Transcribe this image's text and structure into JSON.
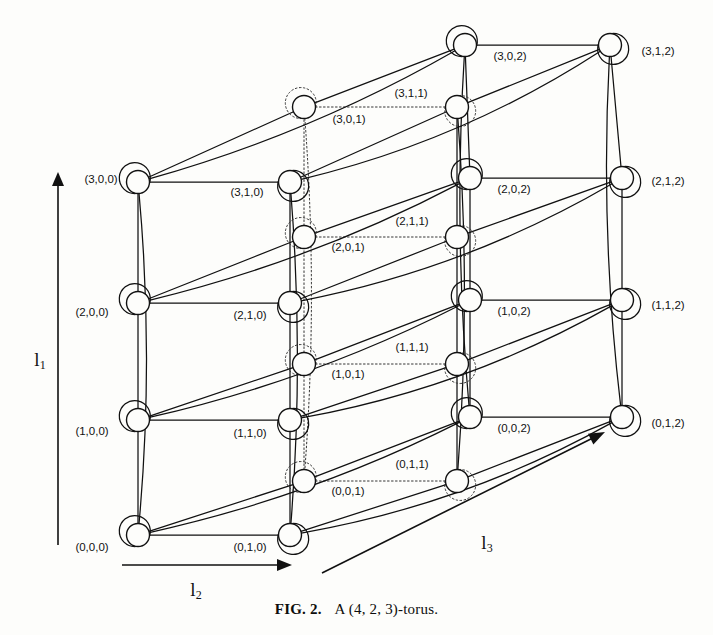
{
  "figure": {
    "caption_number": "FIG. 2.",
    "caption_text": "A (4, 2, 3)-torus.",
    "torus_dims": [
      4,
      2,
      3
    ]
  },
  "axes": [
    {
      "name": "l1",
      "label": "l",
      "sub": "1",
      "direction": "up",
      "x": 58,
      "y1": 545,
      "y2": 172,
      "label_x": 40,
      "label_y": 362
    },
    {
      "name": "l2",
      "label": "l",
      "sub": "2",
      "direction": "right",
      "x1": 122,
      "x2": 292,
      "y": 565,
      "label_x": 196,
      "label_y": 592
    },
    {
      "name": "l3",
      "label": "l",
      "sub": "3",
      "direction": "upright",
      "x1": 322,
      "y1": 573,
      "x2": 605,
      "y2": 432,
      "label_x": 487,
      "label_y": 545
    }
  ],
  "chart_data": {
    "type": "diagram",
    "title": "A (4, 2, 3)-torus",
    "geometry": {
      "origin_x": 138,
      "origin_y": 535,
      "step_i_y": -118.5,
      "step_j_x": 152,
      "step_j_y": 0,
      "step_k_x": 166,
      "step_k_y": -82,
      "node_radius": 11.5
    },
    "nodes": [
      {
        "id": "0,0,0",
        "label": "(0,0,0)",
        "i": 0,
        "j": 0,
        "k": 0,
        "x": 138,
        "y": 535,
        "lx": 92,
        "ly": 548,
        "anchor": "middle"
      },
      {
        "id": "0,1,0",
        "label": "(0,1,0)",
        "i": 0,
        "j": 1,
        "k": 0,
        "x": 290,
        "y": 535,
        "lx": 250,
        "ly": 548,
        "anchor": "middle"
      },
      {
        "id": "1,0,0",
        "label": "(1,0,0)",
        "i": 1,
        "j": 0,
        "k": 0,
        "x": 138,
        "y": 420,
        "lx": 92,
        "ly": 432,
        "anchor": "middle"
      },
      {
        "id": "1,1,0",
        "label": "(1,1,0)",
        "i": 1,
        "j": 1,
        "k": 0,
        "x": 290,
        "y": 420,
        "lx": 250,
        "ly": 434,
        "anchor": "middle"
      },
      {
        "id": "2,0,0",
        "label": "(2,0,0)",
        "i": 2,
        "j": 0,
        "k": 0,
        "x": 138,
        "y": 303,
        "lx": 92,
        "ly": 313,
        "anchor": "middle"
      },
      {
        "id": "2,1,0",
        "label": "(2,1,0)",
        "i": 2,
        "j": 1,
        "k": 0,
        "x": 290,
        "y": 303,
        "lx": 250,
        "ly": 316,
        "anchor": "middle"
      },
      {
        "id": "3,0,0",
        "label": "(3,0,0)",
        "i": 3,
        "j": 0,
        "k": 0,
        "x": 138,
        "y": 182,
        "lx": 101,
        "ly": 180,
        "anchor": "middle"
      },
      {
        "id": "3,1,0",
        "label": "(3,1,0)",
        "i": 3,
        "j": 1,
        "k": 0,
        "x": 290,
        "y": 182,
        "lx": 247,
        "ly": 193,
        "anchor": "middle"
      },
      {
        "id": "0,0,1",
        "label": "(0,0,1)",
        "i": 0,
        "j": 0,
        "k": 1,
        "x": 304,
        "y": 481,
        "lx": 348,
        "ly": 492,
        "anchor": "middle"
      },
      {
        "id": "0,1,1",
        "label": "(0,1,1)",
        "i": 0,
        "j": 1,
        "k": 1,
        "x": 457,
        "y": 481,
        "lx": 412,
        "ly": 465,
        "anchor": "middle"
      },
      {
        "id": "1,0,1",
        "label": "(1,0,1)",
        "i": 1,
        "j": 0,
        "k": 1,
        "x": 304,
        "y": 364,
        "lx": 348,
        "ly": 375,
        "anchor": "middle"
      },
      {
        "id": "1,1,1",
        "label": "(1,1,1)",
        "i": 1,
        "j": 1,
        "k": 1,
        "x": 457,
        "y": 364,
        "lx": 412,
        "ly": 348,
        "anchor": "middle"
      },
      {
        "id": "2,0,1",
        "label": "(2,0,1)",
        "i": 2,
        "j": 0,
        "k": 1,
        "x": 304,
        "y": 237,
        "lx": 348,
        "ly": 248,
        "anchor": "middle"
      },
      {
        "id": "2,1,1",
        "label": "(2,1,1)",
        "i": 2,
        "j": 1,
        "k": 1,
        "x": 457,
        "y": 237,
        "lx": 412,
        "ly": 222,
        "anchor": "middle"
      },
      {
        "id": "3,0,1",
        "label": "(3,0,1)",
        "i": 3,
        "j": 0,
        "k": 1,
        "x": 304,
        "y": 107,
        "lx": 349,
        "ly": 120,
        "anchor": "middle"
      },
      {
        "id": "3,1,1",
        "label": "(3,1,1)",
        "i": 3,
        "j": 1,
        "k": 1,
        "x": 457,
        "y": 107,
        "lx": 411,
        "ly": 94,
        "anchor": "middle"
      },
      {
        "id": "0,0,2",
        "label": "(0,0,2)",
        "i": 0,
        "j": 0,
        "k": 2,
        "x": 470,
        "y": 417,
        "lx": 514,
        "ly": 429,
        "anchor": "middle"
      },
      {
        "id": "0,1,2",
        "label": "(0,1,2)",
        "i": 0,
        "j": 1,
        "k": 2,
        "x": 622,
        "y": 417,
        "lx": 668,
        "ly": 424,
        "anchor": "middle"
      },
      {
        "id": "1,0,2",
        "label": "(1,0,2)",
        "i": 1,
        "j": 0,
        "k": 2,
        "x": 470,
        "y": 300,
        "lx": 514,
        "ly": 312,
        "anchor": "middle"
      },
      {
        "id": "1,1,2",
        "label": "(1,1,2)",
        "i": 1,
        "j": 1,
        "k": 2,
        "x": 622,
        "y": 300,
        "lx": 668,
        "ly": 306,
        "anchor": "middle"
      },
      {
        "id": "2,0,2",
        "label": "(2,0,2)",
        "i": 2,
        "j": 0,
        "k": 2,
        "x": 470,
        "y": 178,
        "lx": 514,
        "ly": 190,
        "anchor": "middle"
      },
      {
        "id": "2,1,2",
        "label": "(2,1,2)",
        "i": 2,
        "j": 1,
        "k": 2,
        "x": 622,
        "y": 178,
        "lx": 668,
        "ly": 182,
        "anchor": "middle"
      },
      {
        "id": "3,0,2",
        "label": "(3,0,2)",
        "i": 3,
        "j": 0,
        "k": 2,
        "x": 465,
        "y": 45,
        "lx": 510,
        "ly": 57,
        "anchor": "middle"
      },
      {
        "id": "3,1,2",
        "label": "(3,1,2)",
        "i": 3,
        "j": 1,
        "k": 2,
        "x": 610,
        "y": 45,
        "lx": 658,
        "ly": 52,
        "anchor": "middle"
      }
    ]
  }
}
